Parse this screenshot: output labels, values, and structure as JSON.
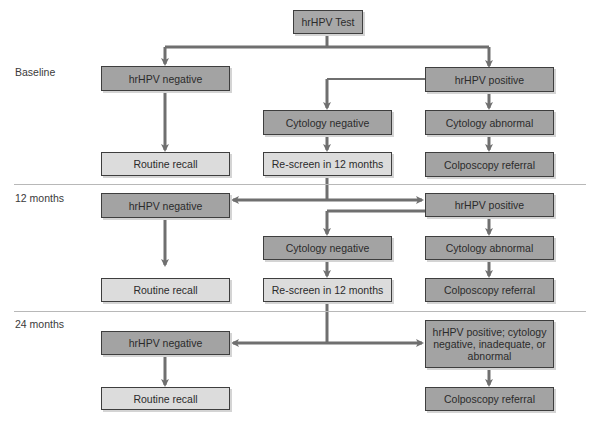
{
  "colors": {
    "dark_box": "#a3a3a3",
    "light_box": "#dcdcdc",
    "arrow": "#6f6f6f",
    "divider": "#b8b8b8"
  },
  "root": {
    "label": "hrHPV Test"
  },
  "rows": [
    {
      "label": "Baseline",
      "boxes": {
        "hpv_negative": "hrHPV negative",
        "hpv_positive": "hrHPV positive",
        "cytology_negative": "Cytology negative",
        "cytology_abnormal": "Cytology abnormal",
        "routine_recall": "Routine recall",
        "rescreen": "Re-screen in 12 months",
        "colposcopy": "Colposcopy referral"
      }
    },
    {
      "label": "12 months",
      "boxes": {
        "hpv_negative": "hrHPV negative",
        "hpv_positive": "hrHPV positive",
        "cytology_negative": "Cytology negative",
        "cytology_abnormal": "Cytology abnormal",
        "routine_recall": "Routine recall",
        "rescreen": "Re-screen in 12 months",
        "colposcopy": "Colposcopy referral"
      }
    },
    {
      "label": "24 months",
      "boxes": {
        "hpv_negative": "hrHPV negative",
        "hpv_positive_combined": "hrHPV positive; cytology negative, inadequate, or abnormal",
        "routine_recall": "Routine recall",
        "colposcopy": "Colposcopy referral"
      }
    }
  ]
}
